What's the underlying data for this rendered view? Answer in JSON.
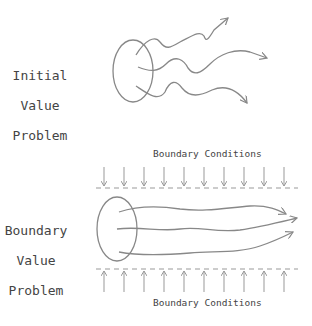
{
  "diagram": {
    "ivp": {
      "label_line1": "Initial",
      "label_line2": "Value",
      "label_line3": "Problem"
    },
    "bvp": {
      "label_line1": "Boundary",
      "label_line2": "Value",
      "label_line3": "Problem",
      "top_condition_label": "Boundary Conditions",
      "bottom_condition_label": "Boundary Conditions"
    },
    "colors": {
      "stroke": "#888888",
      "text": "#444444"
    }
  }
}
